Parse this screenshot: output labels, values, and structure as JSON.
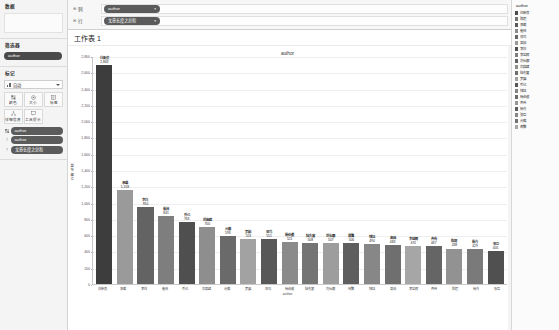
{
  "sidebar": {
    "data_section_title": "数据",
    "dimensions_title": "筛选器",
    "dimension_pill": "author",
    "marks_title": "标记",
    "marks_type": "自动",
    "marks_type_icon": "bar-chart-icon",
    "mark_buttons": [
      {
        "label": "颜色",
        "icon": "color-icon"
      },
      {
        "label": "大小",
        "icon": "size-icon"
      },
      {
        "label": "标签",
        "icon": "label-icon"
      },
      {
        "label": "详细信息",
        "icon": "detail-icon"
      },
      {
        "label": "工具提示",
        "icon": "tooltip-icon"
      }
    ],
    "mark_pills": [
      {
        "icon": "color-legend-icon",
        "label": "author"
      },
      {
        "icon": "abc-icon",
        "label": "author"
      },
      {
        "icon": "abc-icon",
        "label": "文章长度之总和"
      }
    ]
  },
  "shelves": {
    "columns_label": "列",
    "rows_label": "行",
    "columns_pill": "author",
    "rows_pill": "文章长度之总和",
    "caret": "▾"
  },
  "worksheet": {
    "tab_title": "工作表 1"
  },
  "legend": {
    "title": "author",
    "items": [
      {
        "label": "白新良",
        "color": "#4c4c4c"
      },
      {
        "label": "陈超",
        "color": "#737373"
      },
      {
        "label": "承载",
        "color": "#5a5a5a"
      },
      {
        "label": "崔林",
        "color": "#8a8a8a"
      },
      {
        "label": "邓乌",
        "color": "#666666"
      },
      {
        "label": "高帅",
        "color": "#9a9a9a"
      },
      {
        "label": "李白",
        "color": "#4f4f4f"
      },
      {
        "label": "李益辉",
        "color": "#7d7d7d"
      },
      {
        "label": "刘长卿",
        "color": "#606060"
      },
      {
        "label": "刘高峰",
        "color": "#8e8e8e"
      },
      {
        "label": "陆先富",
        "color": "#6e6e6e"
      },
      {
        "label": "罗婷",
        "color": "#a0a0a0"
      },
      {
        "label": "乔己",
        "color": "#555555"
      },
      {
        "label": "钱钰",
        "color": "#828282"
      },
      {
        "label": "杨伯俊",
        "color": "#696969"
      },
      {
        "label": "齐传",
        "color": "#959595"
      },
      {
        "label": "杨方",
        "color": "#5d5d5d"
      },
      {
        "label": "张巨",
        "color": "#888888"
      },
      {
        "label": "元稹",
        "color": "#717171"
      },
      {
        "label": "周繁",
        "color": "#a6a6a6"
      }
    ]
  },
  "chart_data": {
    "type": "bar",
    "title": "author",
    "xlabel": "author",
    "ylabel": "文章长度",
    "ylim": [
      0,
      2800
    ],
    "ytick_step": 200,
    "yticks": [
      0,
      200,
      400,
      600,
      800,
      1000,
      1200,
      1400,
      1600,
      1800,
      2000,
      2200,
      2400,
      2600,
      2800
    ],
    "grid": true,
    "legend_position": "right",
    "categories": [
      "白新良",
      "承载",
      "李白",
      "崔林",
      "乔己",
      "刘高峰",
      "元稹",
      "罗婷",
      "邓乌",
      "杨伯俊",
      "陆先富",
      "刘长卿",
      "周繁",
      "钱钰",
      "高帅",
      "李益辉",
      "齐传",
      "陈超",
      "杨方",
      "张巨"
    ],
    "values": [
      2843,
      1158,
      950,
      841,
      763,
      700,
      593,
      553,
      551,
      521,
      508,
      507,
      506,
      494,
      483,
      470,
      467,
      438,
      429,
      405
    ],
    "bar_colors": [
      "#3d3d3d",
      "#9a9a9a",
      "#636363",
      "#7e7e7e",
      "#4f4f4f",
      "#8e8e8e",
      "#6a6a6a",
      "#a2a2a2",
      "#585858",
      "#8a8a8a",
      "#747474",
      "#9d9d9d",
      "#5e5e5e",
      "#878787",
      "#6f6f6f",
      "#a6a6a6",
      "#656565",
      "#929292",
      "#7a7a7a",
      "#505050"
    ]
  }
}
